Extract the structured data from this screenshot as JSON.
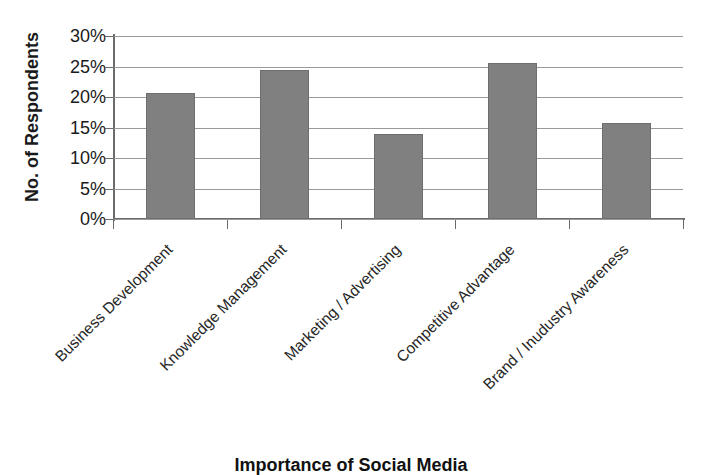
{
  "chart_data": {
    "type": "bar",
    "title": "Importance of Social Media",
    "xlabel": "Importance of Social Media",
    "ylabel": "No. of Respondents",
    "ylim": [
      0,
      30
    ],
    "yunit": "%",
    "grid": true,
    "legend": "none",
    "bar_color": "#808080",
    "bar_edge_color": "#6e6e6e",
    "axis_color": "#6b6b6b",
    "gridline_color": "#9a9a9a",
    "text_color": "#1a1a1a",
    "ytick_labels": [
      "30%",
      "25%",
      "20%",
      "15%",
      "10%",
      "5%",
      "0%"
    ],
    "ytick_values": [
      30,
      25,
      20,
      15,
      10,
      5,
      0
    ],
    "categories": [
      "Business Development",
      "Knowledge Management",
      "Marketing / Advertising",
      "Competitive Advantage",
      "Brand / Inudustry Awareness"
    ],
    "values": [
      20.6,
      24.5,
      14.0,
      25.6,
      15.7
    ]
  }
}
